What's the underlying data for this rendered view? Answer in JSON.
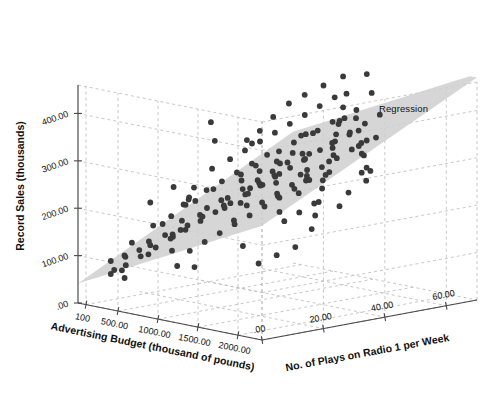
{
  "chart_data": {
    "type": "scatter",
    "subtype": "3d-scatter-with-regression-plane",
    "title": "",
    "xlabel": "Advertising Budget (thousand of pounds)",
    "ylabel": "Record Sales (thousands)",
    "zlabel": "No. of Plays on Radio 1 per Week",
    "xticklabels": [
      "100",
      "500.00",
      "1000.00",
      "1500.00",
      "2000.00"
    ],
    "xtickvalues": [
      100,
      500,
      1000,
      1500,
      2000
    ],
    "yticklabels": [
      ".00",
      "100.00",
      "200.00",
      "300.00",
      "400.00"
    ],
    "ytickvalues": [
      0,
      100,
      200,
      300,
      400
    ],
    "zticklabels": [
      ".00",
      "20.00",
      "40.00",
      "60.00"
    ],
    "ztickvalues": [
      0,
      20,
      40,
      60
    ],
    "xlim": [
      0,
      2300
    ],
    "ylim": [
      0,
      460
    ],
    "zlim": [
      0,
      70
    ],
    "grid": true,
    "legend_position": "inside-right",
    "annotations": [
      {
        "text": "Regression",
        "x": 379,
        "y": 103
      }
    ],
    "series": [
      {
        "name": "Record Sales",
        "marker": "circle",
        "color": "#3a3a3a",
        "points": [
          [
            10.26,
            330,
            43
          ],
          [
            985.69,
            120,
            28
          ],
          [
            1445.56,
            360,
            35
          ],
          [
            1188.19,
            270,
            33
          ],
          [
            574.51,
            220,
            44
          ],
          [
            568.95,
            170,
            19
          ],
          [
            471.81,
            70,
            20
          ],
          [
            537.35,
            210,
            22
          ],
          [
            514.07,
            200,
            21
          ],
          [
            174.09,
            300,
            40
          ],
          [
            1720.81,
            290,
            37
          ],
          [
            611.48,
            70,
            22
          ],
          [
            251.19,
            150,
            21
          ],
          [
            97.97,
            190,
            21
          ],
          [
            406.81,
            100,
            20
          ],
          [
            265.4,
            120,
            24
          ],
          [
            1323.29,
            270,
            38
          ],
          [
            196.65,
            220,
            26
          ],
          [
            1326.59,
            280,
            31
          ],
          [
            1380.69,
            230,
            19
          ],
          [
            792.34,
            320,
            36
          ],
          [
            957.17,
            210,
            28
          ],
          [
            1789.66,
            230,
            19
          ],
          [
            656.14,
            230,
            27
          ],
          [
            613.8,
            190,
            26
          ],
          [
            313.36,
            200,
            28
          ],
          [
            336.51,
            220,
            29
          ],
          [
            1544.93,
            270,
            34
          ],
          [
            68.95,
            60,
            10
          ],
          [
            785.69,
            200,
            27
          ],
          [
            1286.12,
            260,
            31
          ],
          [
            1143.42,
            290,
            36
          ],
          [
            1027.47,
            180,
            24
          ],
          [
            1315.91,
            310,
            41
          ],
          [
            1422.33,
            240,
            28
          ],
          [
            1607.27,
            250,
            30
          ],
          [
            1793.0,
            280,
            33
          ],
          [
            1012.2,
            230,
            29
          ],
          [
            872.94,
            200,
            25
          ],
          [
            999.2,
            240,
            30
          ],
          [
            1116.5,
            250,
            31
          ],
          [
            1327.0,
            300,
            39
          ],
          [
            1520.4,
            290,
            35
          ],
          [
            1657.9,
            320,
            40
          ],
          [
            1935.0,
            330,
            42
          ],
          [
            2087.0,
            300,
            38
          ],
          [
            2191.0,
            270,
            31
          ],
          [
            2271.0,
            250,
            26
          ],
          [
            2234.0,
            310,
            37
          ],
          [
            1959.0,
            360,
            46
          ],
          [
            1821.0,
            340,
            44
          ],
          [
            1550.0,
            350,
            48
          ],
          [
            1411.0,
            330,
            46
          ],
          [
            1298.0,
            360,
            51
          ],
          [
            1133.0,
            340,
            47
          ],
          [
            1033.0,
            300,
            43
          ],
          [
            911.0,
            280,
            41
          ],
          [
            811.0,
            260,
            38
          ],
          [
            700.0,
            240,
            35
          ],
          [
            601.0,
            200,
            31
          ],
          [
            488.0,
            170,
            27
          ],
          [
            399.0,
            140,
            23
          ],
          [
            321.0,
            130,
            20
          ],
          [
            251.0,
            110,
            17
          ],
          [
            190.0,
            100,
            15
          ],
          [
            120.0,
            90,
            12
          ],
          [
            65.0,
            80,
            9
          ],
          [
            231.0,
            180,
            29
          ],
          [
            341.0,
            210,
            33
          ],
          [
            455.0,
            230,
            35
          ],
          [
            566.0,
            250,
            37
          ],
          [
            677.0,
            270,
            39
          ],
          [
            790.0,
            290,
            41
          ],
          [
            900.0,
            300,
            42
          ],
          [
            1010.0,
            320,
            44
          ],
          [
            1120.0,
            340,
            45
          ],
          [
            1230.0,
            350,
            46
          ],
          [
            1340.0,
            370,
            48
          ],
          [
            1450.0,
            380,
            49
          ],
          [
            1560.0,
            400,
            50
          ],
          [
            1670.0,
            390,
            47
          ],
          [
            1780.0,
            370,
            45
          ],
          [
            1890.0,
            350,
            43
          ],
          [
            2000.0,
            330,
            41
          ],
          [
            2110.0,
            310,
            39
          ],
          [
            2220.0,
            290,
            36
          ],
          [
            180.0,
            60,
            6
          ],
          [
            290.0,
            80,
            8
          ],
          [
            400.0,
            100,
            10
          ],
          [
            510.0,
            120,
            12
          ],
          [
            620.0,
            140,
            14
          ],
          [
            730.0,
            160,
            16
          ],
          [
            840.0,
            180,
            18
          ],
          [
            950.0,
            200,
            20
          ],
          [
            1060.0,
            220,
            22
          ],
          [
            1170.0,
            240,
            24
          ],
          [
            1280.0,
            260,
            26
          ],
          [
            1390.0,
            280,
            28
          ],
          [
            1500.0,
            300,
            30
          ],
          [
            1610.0,
            320,
            32
          ],
          [
            1720.0,
            340,
            34
          ],
          [
            1830.0,
            360,
            36
          ],
          [
            1940.0,
            380,
            38
          ],
          [
            2050.0,
            400,
            40
          ],
          [
            2160.0,
            420,
            42
          ],
          [
            95.0,
            140,
            22
          ],
          [
            205.0,
            160,
            25
          ],
          [
            315.0,
            190,
            30
          ],
          [
            425.0,
            130,
            12
          ],
          [
            535.0,
            110,
            9
          ],
          [
            645.0,
            150,
            14
          ],
          [
            755.0,
            170,
            16
          ],
          [
            865.0,
            190,
            18
          ],
          [
            975.0,
            130,
            11
          ],
          [
            1085.0,
            150,
            13
          ],
          [
            1195.0,
            170,
            15
          ],
          [
            1305.0,
            190,
            17
          ],
          [
            1415.0,
            210,
            19
          ],
          [
            1525.0,
            230,
            21
          ],
          [
            1635.0,
            250,
            23
          ],
          [
            1745.0,
            270,
            25
          ],
          [
            1855.0,
            290,
            27
          ],
          [
            1965.0,
            220,
            16
          ],
          [
            2075.0,
            240,
            18
          ],
          [
            2185.0,
            260,
            20
          ],
          [
            140.0,
            240,
            40
          ],
          [
            250.0,
            260,
            43
          ],
          [
            360.0,
            280,
            45
          ],
          [
            470.0,
            300,
            47
          ],
          [
            580.0,
            320,
            49
          ],
          [
            690.0,
            340,
            51
          ],
          [
            800.0,
            360,
            53
          ],
          [
            910.0,
            380,
            55
          ],
          [
            1020.0,
            400,
            57
          ],
          [
            1130.0,
            410,
            58
          ],
          [
            1240.0,
            390,
            54
          ],
          [
            1350.0,
            370,
            50
          ],
          [
            1460.0,
            350,
            46
          ],
          [
            1570.0,
            330,
            42
          ],
          [
            1680.0,
            310,
            38
          ],
          [
            1790.0,
            290,
            34
          ],
          [
            1900.0,
            270,
            30
          ],
          [
            2010.0,
            250,
            26
          ],
          [
            2120.0,
            230,
            22
          ],
          [
            2230.0,
            210,
            18
          ],
          [
            60.0,
            110,
            16
          ],
          [
            170.0,
            90,
            11
          ],
          [
            280.0,
            70,
            7
          ],
          [
            390.0,
            60,
            5
          ],
          [
            500.0,
            240,
            40
          ],
          [
            610.0,
            260,
            42
          ],
          [
            720.0,
            210,
            30
          ],
          [
            830.0,
            230,
            32
          ],
          [
            940.0,
            250,
            34
          ],
          [
            1050.0,
            270,
            36
          ],
          [
            1160.0,
            290,
            38
          ],
          [
            1270.0,
            310,
            40
          ],
          [
            1380.0,
            230,
            24
          ],
          [
            1490.0,
            250,
            26
          ],
          [
            1600.0,
            270,
            28
          ],
          [
            1710.0,
            290,
            30
          ],
          [
            1820.0,
            310,
            32
          ],
          [
            1930.0,
            330,
            34
          ],
          [
            2040.0,
            350,
            36
          ],
          [
            2150.0,
            370,
            38
          ],
          [
            1010.0,
            440,
            60
          ],
          [
            1230.0,
            450,
            62
          ],
          [
            880.0,
            420,
            57
          ],
          [
            1560.0,
            430,
            55
          ],
          [
            760.0,
            400,
            54
          ],
          [
            640.0,
            380,
            52
          ],
          [
            520.0,
            350,
            50
          ],
          [
            430.0,
            320,
            48
          ],
          [
            345.0,
            300,
            46
          ],
          [
            2255.0,
            180,
            12
          ],
          [
            2100.0,
            160,
            10
          ],
          [
            1950.0,
            140,
            8
          ]
        ]
      }
    ],
    "plane": {
      "name": "Regression",
      "color": "#cfcfcf",
      "description": "fitted regression plane rendered as a shaded surface"
    }
  },
  "axis_titles": {
    "x": "Advertising Budget (thousand of pounds)",
    "y": "Record Sales (thousands)",
    "z": "No. of Plays on Radio 1 per Week"
  },
  "regression_label": "Regression"
}
